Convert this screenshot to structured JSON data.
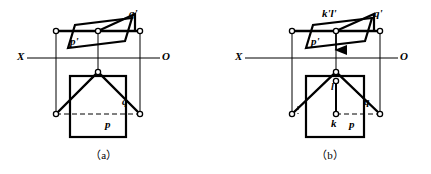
{
  "figure": {
    "type": "descriptive-geometry-projection-diagram",
    "width": 431,
    "height": 174,
    "background_color": "#ffffff",
    "line_color": "#000000",
    "panels": [
      {
        "id": "a",
        "caption": "（a）",
        "caption_pos": {
          "x": 92,
          "y": 147
        },
        "axis": {
          "left_label": "X",
          "right_label": "O",
          "left_label_pos": {
            "x": 17,
            "y": 51
          },
          "right_label_pos": {
            "x": 162,
            "y": 51
          },
          "y": 58,
          "x_start": 27,
          "x_end": 160
        },
        "labels": [
          {
            "name": "q-prime",
            "text": "q'",
            "x": 129,
            "y": 12
          },
          {
            "name": "p-prime",
            "text": "p'",
            "x": 70,
            "y": 40
          },
          {
            "name": "q",
            "text": "q",
            "x": 122,
            "y": 100
          },
          {
            "name": "p",
            "text": "p",
            "x": 105,
            "y": 123
          }
        ],
        "vertex_markers": [
          {
            "x": 56,
            "y": 31
          },
          {
            "x": 98,
            "y": 31
          },
          {
            "x": 140,
            "y": 31
          },
          {
            "x": 98,
            "y": 72
          },
          {
            "x": 56,
            "y": 114
          },
          {
            "x": 140,
            "y": 114
          }
        ],
        "frontal_plane": {
          "top_edge": {
            "x1": 56,
            "y1": 31,
            "x2": 140,
            "y2": 31
          },
          "left_vertical": {
            "x1": 56,
            "y1": 31,
            "x2": 56,
            "y2": 114
          },
          "mid_vertical": {
            "x1": 98,
            "y1": 31,
            "x2": 98,
            "y2": 72
          },
          "right_vertical": {
            "x1": 140,
            "y1": 31,
            "x2": 140,
            "y2": 114
          }
        },
        "p_prime_parallelogram": [
          {
            "x": 68,
            "y": 48
          },
          {
            "x": 75,
            "y": 25
          },
          {
            "x": 132,
            "y": 18
          },
          {
            "x": 125,
            "y": 41
          }
        ],
        "q_prime_strip": [
          {
            "x": 98,
            "y": 31
          },
          {
            "x": 135,
            "y": 14
          },
          {
            "x": 135,
            "y": 31
          }
        ],
        "h_square": {
          "x": 70,
          "y": 76,
          "w": 56,
          "h": 61
        },
        "h_triangle": [
          {
            "x": 56,
            "y": 114
          },
          {
            "x": 98,
            "y": 72
          },
          {
            "x": 140,
            "y": 114
          }
        ],
        "dashed_lines": [
          {
            "x1": 56,
            "y1": 114,
            "x2": 140,
            "y2": 114
          },
          {
            "x1": 62,
            "y1": 108,
            "x2": 98,
            "y2": 75
          }
        ]
      },
      {
        "id": "b",
        "caption": "（b）",
        "caption_pos": {
          "x": 318,
          "y": 147
        },
        "axis": {
          "left_label": "X",
          "right_label": "O",
          "left_label_pos": {
            "x": 235,
            "y": 51
          },
          "right_label_pos": {
            "x": 400,
            "y": 51
          },
          "y": 58,
          "x_start": 245,
          "x_end": 398
        },
        "labels": [
          {
            "name": "k-prime-l-prime",
            "text": "k'l'",
            "x": 322,
            "y": 12
          },
          {
            "name": "q-prime",
            "text": "q'",
            "x": 374,
            "y": 12
          },
          {
            "name": "p-prime",
            "text": "p'",
            "x": 311,
            "y": 40
          },
          {
            "name": "l",
            "text": "l",
            "x": 332,
            "y": 85
          },
          {
            "name": "q",
            "text": "q",
            "x": 364,
            "y": 100
          },
          {
            "name": "k",
            "text": "k",
            "x": 330,
            "y": 122
          },
          {
            "name": "p",
            "text": "p",
            "x": 348,
            "y": 123
          }
        ],
        "vertex_markers": [
          {
            "x": 292,
            "y": 31
          },
          {
            "x": 336,
            "y": 31
          },
          {
            "x": 380,
            "y": 31
          },
          {
            "x": 336,
            "y": 72
          },
          {
            "x": 336,
            "y": 81
          },
          {
            "x": 292,
            "y": 114
          },
          {
            "x": 336,
            "y": 114
          },
          {
            "x": 380,
            "y": 114
          }
        ],
        "frontal_plane": {
          "top_edge": {
            "x1": 292,
            "y1": 31,
            "x2": 380,
            "y2": 31
          },
          "left_vertical": {
            "x1": 292,
            "y1": 31,
            "x2": 292,
            "y2": 114
          },
          "mid_vertical": {
            "x1": 336,
            "y1": 31,
            "x2": 336,
            "y2": 114
          },
          "right_vertical": {
            "x1": 380,
            "y1": 31,
            "x2": 380,
            "y2": 114
          }
        },
        "p_prime_parallelogram": [
          {
            "x": 306,
            "y": 48
          },
          {
            "x": 313,
            "y": 25
          },
          {
            "x": 372,
            "y": 18
          },
          {
            "x": 365,
            "y": 41
          }
        ],
        "q_prime_strip": [
          {
            "x": 336,
            "y": 31
          },
          {
            "x": 374,
            "y": 14
          },
          {
            "x": 374,
            "y": 31
          }
        ],
        "arrow": {
          "x": 336,
          "y1": 33,
          "y2": 53
        },
        "h_square": {
          "x": 306,
          "y": 76,
          "w": 58,
          "h": 61
        },
        "h_triangle": [
          {
            "x": 292,
            "y": 114
          },
          {
            "x": 336,
            "y": 72
          },
          {
            "x": 380,
            "y": 114
          }
        ],
        "l_k_segment": {
          "x1": 336,
          "y1": 81,
          "x2": 336,
          "y2": 114
        },
        "dashed_lines": [
          {
            "x1": 336,
            "y1": 114,
            "x2": 380,
            "y2": 114
          },
          {
            "x1": 298,
            "y1": 108,
            "x2": 298,
            "y2": 114
          },
          {
            "x1": 352,
            "y1": 88,
            "x2": 372,
            "y2": 107
          }
        ]
      }
    ]
  }
}
